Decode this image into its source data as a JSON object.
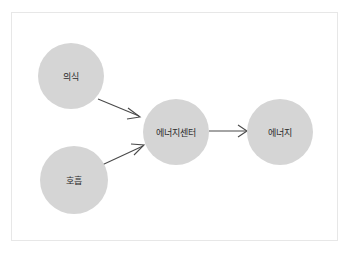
{
  "panel": {
    "background_color": "#ffffff",
    "border_color": "#e7e7e7"
  },
  "diagram": {
    "type": "flowchart",
    "node_fill_color": "#d5d5d5",
    "edge_color": "#4a4a4a",
    "label_color": "#2b2b2b",
    "nodes": [
      {
        "id": "consciousness",
        "label": "의식",
        "cx": 71,
        "cy": 76,
        "r": 33
      },
      {
        "id": "breathing",
        "label": "호흡",
        "cx": 74,
        "cy": 180,
        "r": 34
      },
      {
        "id": "energy-center",
        "label": "에너지센터",
        "cx": 176,
        "cy": 132,
        "r": 33
      },
      {
        "id": "energy",
        "label": "에너지",
        "cx": 280,
        "cy": 132,
        "r": 33
      }
    ],
    "edges": [
      {
        "id": "consciousness-to-energy-center",
        "from": "의식",
        "to": "에너지센터"
      },
      {
        "id": "breathing-to-energy-center",
        "from": "호흡",
        "to": "에너지센터"
      },
      {
        "id": "energy-center-to-energy",
        "from": "에너지센터",
        "to": "에너지"
      }
    ]
  }
}
